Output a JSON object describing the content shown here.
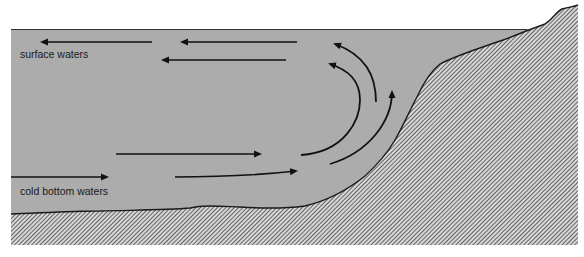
{
  "diagram": {
    "type": "cross-section",
    "labels": {
      "surface": "surface waters",
      "bottom": "cold bottom waters"
    },
    "colors": {
      "water": "#acacac",
      "land_hatch": "#3a3a3a",
      "land_bg": "#d8d8d8",
      "arrow": "#111111",
      "outline": "#1a1a1a"
    },
    "flows": [
      {
        "id": "surface-arrow-1",
        "direction": "left"
      },
      {
        "id": "surface-arrow-2",
        "direction": "left"
      },
      {
        "id": "surface-arrow-3",
        "direction": "left"
      },
      {
        "id": "bottom-arrow-1",
        "direction": "right"
      },
      {
        "id": "bottom-arrow-2",
        "direction": "right"
      },
      {
        "id": "bottom-arrow-3",
        "direction": "right"
      },
      {
        "id": "upwelling-arc-1",
        "direction": "up-left"
      },
      {
        "id": "upwelling-arc-2",
        "direction": "up-left"
      },
      {
        "id": "upwelling-arc-3",
        "direction": "up"
      }
    ]
  }
}
